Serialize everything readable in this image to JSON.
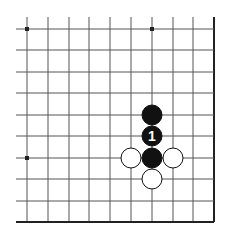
{
  "board": {
    "columns": 10,
    "rows": 10,
    "x_lines": [
      27,
      48,
      69,
      89,
      110,
      131,
      152,
      173,
      193,
      214
    ],
    "y_lines": [
      29,
      50,
      72,
      93,
      115,
      136,
      158,
      179,
      201,
      222
    ],
    "line_color": "#555555",
    "edge_color": "#222222",
    "open_left_extent": 16,
    "open_top_extent": 17,
    "edges": [
      "right",
      "bottom"
    ]
  },
  "star_points": [
    {
      "col": 0,
      "row": 0
    },
    {
      "col": 6,
      "row": 0
    },
    {
      "col": 0,
      "row": 6
    }
  ],
  "stones": [
    {
      "color": "black",
      "col": 6,
      "row": 4,
      "label": ""
    },
    {
      "color": "black",
      "col": 6,
      "row": 5,
      "label": "1"
    },
    {
      "color": "black",
      "col": 6,
      "row": 6,
      "label": ""
    },
    {
      "color": "white",
      "col": 5,
      "row": 6,
      "label": ""
    },
    {
      "color": "white",
      "col": 7,
      "row": 6,
      "label": ""
    },
    {
      "color": "white",
      "col": 6,
      "row": 7,
      "label": ""
    }
  ],
  "stone_radius": 10
}
